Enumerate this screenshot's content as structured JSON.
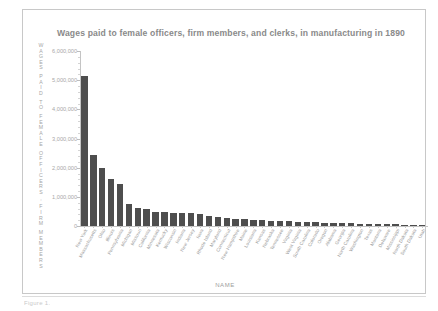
{
  "figure": {
    "title": "Wages paid to female officers, firm members, and clerks, in manufacturing in 1890",
    "y_axis_title": "WAGES PAID TO FEMALE OFFICERS, FIRM MEMBERS",
    "x_axis_title": "NAME",
    "caption": "Figure 1.",
    "bar_color": "#4e4e4e",
    "axis_color": "#c4c4c4",
    "text_color": "#9a9a9a"
  },
  "chart_data": {
    "type": "bar",
    "title": "Wages paid to female officers, firm members, and clerks, in manufacturing in 1890",
    "xlabel": "NAME",
    "ylabel": "WAGES PAID TO FEMALE OFFICERS, FIRM MEMBERS",
    "ylim": [
      0,
      6000000
    ],
    "ytick_labels": [
      "6,000,000",
      "5,000,000",
      "4,000,000",
      "3,000,000",
      "2,000,000",
      "1,000,000",
      "0"
    ],
    "ytick_values": [
      6000000,
      5000000,
      4000000,
      3000000,
      2000000,
      1000000,
      0
    ],
    "grid": false,
    "legend": false,
    "categories": [
      "New York",
      "Massachusetts",
      "Ohio",
      "Illinois",
      "Pennsylvania",
      "Michigan",
      "Missouri",
      "California",
      "Minnesota",
      "Kentucky",
      "Wisconsin",
      "Indiana",
      "New Jersey",
      "Iowa",
      "Rhode Island",
      "Maryland",
      "Connecticut",
      "New Hampshire",
      "Maine",
      "Louisiana",
      "Kansas",
      "Nebraska",
      "Tennessee",
      "Virginia",
      "West Virginia",
      "South Carolina",
      "Colorado",
      "Oregon",
      "Alabama",
      "Georgia",
      "North Carolina",
      "Washington",
      "Texas",
      "Montana",
      "Delaware",
      "Mississippi",
      "North Dakota",
      "South Dakota",
      "Utah"
    ],
    "values": [
      5150000,
      2450000,
      2000000,
      1600000,
      1430000,
      740000,
      620000,
      590000,
      490000,
      470000,
      460000,
      455000,
      450000,
      400000,
      330000,
      300000,
      280000,
      250000,
      230000,
      215000,
      200000,
      185000,
      170000,
      160000,
      150000,
      140000,
      130000,
      120000,
      110000,
      100000,
      92000,
      85000,
      78000,
      70000,
      62000,
      55000,
      46000,
      38000,
      28000
    ]
  }
}
